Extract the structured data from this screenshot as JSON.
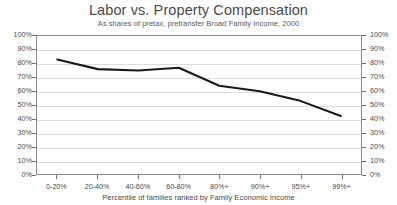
{
  "chart_data": {
    "type": "line",
    "title": "Labor vs. Property Compensation",
    "subtitle": "As shares of pretax, pretransfer Broad Family Income, 2000",
    "xlabel": "Percentile of families ranked by Family Economic Income",
    "ylabel": "",
    "categories": [
      "0-20%",
      "20-40%",
      "40-60%",
      "60-80%",
      "80%+",
      "90%+",
      "95%+",
      "99%+"
    ],
    "series": [
      {
        "name": "Labor compensation share",
        "values": [
          83,
          76,
          75,
          77,
          64,
          60,
          53,
          42
        ],
        "color": "#1a1a1a"
      }
    ],
    "ylim": [
      0,
      100
    ],
    "y_ticks": [
      "0%",
      "10%",
      "20%",
      "30%",
      "40%",
      "50%",
      "60%",
      "70%",
      "80%",
      "90%",
      "100%"
    ],
    "y_tick_values": [
      0,
      10,
      20,
      30,
      40,
      50,
      60,
      70,
      80,
      90,
      100
    ],
    "right_axis_ticks": [
      "0%",
      "10%",
      "20%",
      "30%",
      "40%",
      "50%",
      "60%",
      "70%",
      "80%",
      "90%",
      "100%"
    ],
    "grid": true,
    "legend": false,
    "legend_position": "none",
    "colors": {
      "line": "#1a1a1a",
      "gridline": "#dcdcdc",
      "axis": "#8a8a8a",
      "text": "#4a4a4a",
      "background": "#ffffff"
    }
  }
}
